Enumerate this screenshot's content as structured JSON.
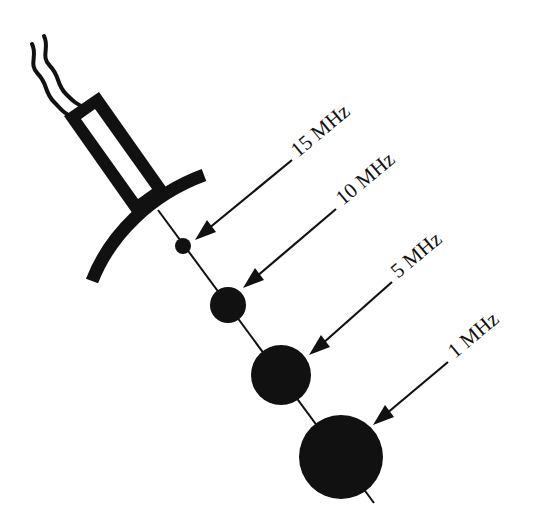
{
  "diagram": {
    "colors": {
      "ink": "#111111",
      "background": "#ffffff"
    },
    "probe": {
      "icon": "transducer-probe-icon",
      "cable": "wavy-cable-icon",
      "lens": "curved-lens-icon"
    },
    "focal_spots": [
      {
        "label": "15 MHz",
        "cx": 183,
        "cy": 246,
        "r": 8
      },
      {
        "label": "10 MHz",
        "cx": 228,
        "cy": 305,
        "r": 18
      },
      {
        "label": "5 MHz",
        "cx": 281,
        "cy": 375,
        "r": 30
      },
      {
        "label": "1 MHz",
        "cx": 341,
        "cy": 457,
        "r": 42
      }
    ]
  }
}
